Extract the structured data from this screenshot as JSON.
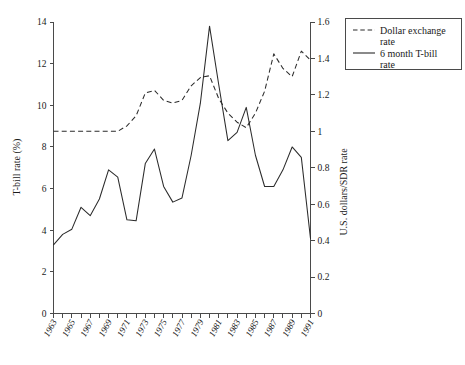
{
  "figure": {
    "background_color": "#ffffff",
    "line_color": "#2b2b2b",
    "axis_color": "#4a4a4a"
  },
  "legend": {
    "position": "top-right",
    "entries": [
      {
        "label_line1": "Dollar exchange",
        "label_line2": "rate",
        "style": "dashed",
        "icon": "dashed-line-swatch"
      },
      {
        "label_line1": "6 month T-bill",
        "label_line2": "rate",
        "style": "solid",
        "icon": "solid-line-swatch"
      }
    ]
  },
  "chart_data": {
    "type": "line",
    "title": "",
    "xlabel": "",
    "ylabel": "T-bill rate (%)",
    "y2label": "U.S. dollars/SDR rate",
    "grid": false,
    "legend_position": "top-right",
    "xlim": [
      1963,
      1991
    ],
    "ylim": [
      0,
      14
    ],
    "y2lim": [
      0,
      1.6
    ],
    "yticks": [
      0,
      2,
      4,
      6,
      8,
      10,
      12,
      14
    ],
    "yticklabels": [
      "0",
      "2",
      "4",
      "6",
      "8",
      "10",
      "12",
      "14"
    ],
    "y2ticks": [
      0,
      0.2,
      0.4,
      0.6,
      0.8,
      1.0,
      1.2,
      1.4,
      1.6
    ],
    "y2ticklabels": [
      "0",
      "0.2",
      "0.4",
      "0.6",
      "0.8",
      "1",
      "1.2",
      "1.4",
      "1.6"
    ],
    "x": [
      1963,
      1964,
      1965,
      1966,
      1967,
      1968,
      1969,
      1970,
      1971,
      1972,
      1973,
      1974,
      1975,
      1976,
      1977,
      1978,
      1979,
      1980,
      1981,
      1982,
      1983,
      1984,
      1985,
      1986,
      1987,
      1988,
      1989,
      1990,
      1991
    ],
    "xticks": [
      1963,
      1964,
      1965,
      1966,
      1967,
      1968,
      1969,
      1970,
      1971,
      1972,
      1973,
      1974,
      1975,
      1976,
      1977,
      1978,
      1979,
      1980,
      1981,
      1982,
      1983,
      1984,
      1985,
      1986,
      1987,
      1988,
      1989,
      1990,
      1991
    ],
    "xticklabels": [
      "1963",
      "",
      "1965",
      "",
      "1967",
      "",
      "1969",
      "",
      "1971",
      "",
      "1973",
      "",
      "1975",
      "",
      "1977",
      "",
      "1979",
      "",
      "1981",
      "",
      "1983",
      "",
      "1985",
      "",
      "1987",
      "",
      "1989",
      "",
      "1991"
    ],
    "series": [
      {
        "name": "6 month T-bill rate",
        "style": "solid",
        "axis": "left",
        "units": "percent",
        "values": [
          3.3,
          3.8,
          4.05,
          5.1,
          4.7,
          5.5,
          6.9,
          6.55,
          4.5,
          4.45,
          7.2,
          7.9,
          6.1,
          5.35,
          5.55,
          7.6,
          10.1,
          13.8,
          11.0,
          8.3,
          8.7,
          9.9,
          7.6,
          6.1,
          6.1,
          6.9,
          8.0,
          7.5,
          3.6
        ]
      },
      {
        "name": "Dollar exchange rate",
        "style": "dashed",
        "axis": "right",
        "units": "US dollars per SDR",
        "values_right_axis": [
          1.0,
          1.0,
          1.0,
          1.0,
          1.0,
          1.0,
          1.0,
          1.0,
          1.03,
          1.085,
          1.21,
          1.225,
          1.17,
          1.155,
          1.17,
          1.25,
          1.295,
          1.305,
          1.18,
          1.1,
          1.05,
          1.02,
          1.1,
          1.22,
          1.425,
          1.345,
          1.3,
          1.44,
          1.39
        ],
        "values_left_axis_equivalent": [
          8.75,
          8.75,
          8.75,
          8.75,
          8.75,
          8.75,
          8.75,
          8.75,
          9.01,
          9.49,
          10.59,
          10.72,
          10.24,
          10.11,
          10.24,
          10.94,
          11.33,
          11.42,
          10.33,
          9.63,
          9.19,
          8.93,
          9.63,
          10.68,
          12.47,
          11.77,
          11.38,
          12.6,
          12.16
        ]
      }
    ]
  }
}
